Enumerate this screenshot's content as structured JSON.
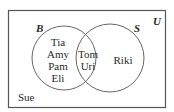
{
  "diagram": {
    "type": "venn",
    "universe_label": "U",
    "sets": [
      {
        "label": "B"
      },
      {
        "label": "S"
      }
    ],
    "regions": {
      "only_B": [
        "Tia",
        "Amy",
        "Pam",
        "Eli"
      ],
      "both": [
        "Tom",
        "Uri"
      ],
      "only_S": [
        "Riki"
      ],
      "neither": [
        "Sue"
      ]
    },
    "colors": {
      "stroke": "#555555",
      "text": "#2a2a2a"
    }
  }
}
